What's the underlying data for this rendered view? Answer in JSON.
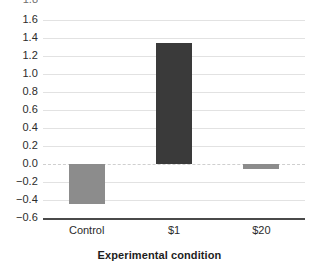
{
  "chart_data": {
    "type": "bar",
    "title": "",
    "subtitle": "",
    "xlabel": "Experimental condition",
    "ylabel": "",
    "categories": [
      "Control",
      "$1",
      "$20"
    ],
    "values": [
      -0.44,
      1.35,
      -0.05
    ],
    "series": [
      {
        "name": "",
        "values": [
          -0.44,
          1.35,
          -0.05
        ]
      }
    ],
    "bar_colors": [
      "#8c8c8c",
      "#3a3a3a",
      "#8c8c8c"
    ],
    "ylim": [
      -0.6,
      1.6
    ],
    "ytick_step": 0.2,
    "ytick_labels": [
      "1.6",
      "1.4",
      "1.2",
      "1.0",
      "0.8",
      "0.6",
      "0.4",
      "0.2",
      "0.0",
      "−0.2",
      "−0.4",
      "−0.6"
    ],
    "ytick_values": [
      1.6,
      1.4,
      1.2,
      1.0,
      0.8,
      0.6,
      0.4,
      0.2,
      0.0,
      -0.2,
      -0.4,
      -0.6
    ],
    "clipped_top_tick_label": "1.8",
    "grid": true,
    "grid_color": "#e2e2e2",
    "zero_line": true,
    "zero_line_color": "#cfcfcf",
    "axis_line_color": "#4a4a4a",
    "legend": null,
    "legend_position": "none",
    "background_color": "#ffffff"
  }
}
